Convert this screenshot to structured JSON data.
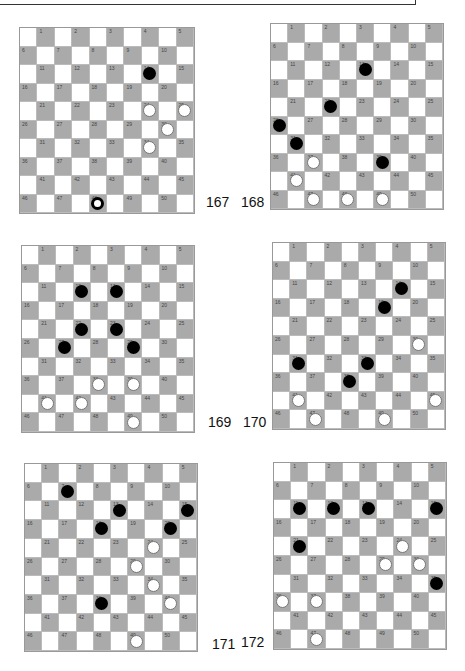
{
  "diagrams": [
    {
      "id": "167",
      "label": "167",
      "black": [
        14
      ],
      "white": [
        24,
        25,
        30,
        34
      ],
      "black_kings": [
        48
      ],
      "white_kings": []
    },
    {
      "id": "168",
      "label": "168",
      "black": [
        13,
        22,
        26,
        31,
        39
      ],
      "white": [
        37,
        41,
        47,
        48,
        49
      ],
      "black_kings": [],
      "white_kings": []
    },
    {
      "id": "169",
      "label": "169",
      "black": [
        12,
        13,
        22,
        23,
        27,
        29
      ],
      "white": [
        38,
        39,
        41,
        42,
        49
      ],
      "black_kings": [],
      "white_kings": []
    },
    {
      "id": "170",
      "label": "170",
      "black": [
        14,
        19,
        31,
        33,
        38
      ],
      "white": [
        30,
        41,
        45,
        47,
        49
      ],
      "black_kings": [],
      "white_kings": []
    },
    {
      "id": "171",
      "label": "171",
      "black": [
        7,
        13,
        15,
        18,
        20,
        38
      ],
      "white": [
        24,
        29,
        34,
        40,
        49
      ],
      "black_kings": [],
      "white_kings": []
    },
    {
      "id": "172",
      "label": "172",
      "black": [
        11,
        12,
        13,
        15,
        21,
        35
      ],
      "white": [
        24,
        29,
        30,
        36,
        37,
        47
      ],
      "black_kings": [],
      "white_kings": []
    }
  ],
  "colors": {
    "dark_square": "#aaaaaa",
    "light_square": "#ffffff",
    "black_piece": "#000000",
    "white_piece": "#ffffff"
  }
}
